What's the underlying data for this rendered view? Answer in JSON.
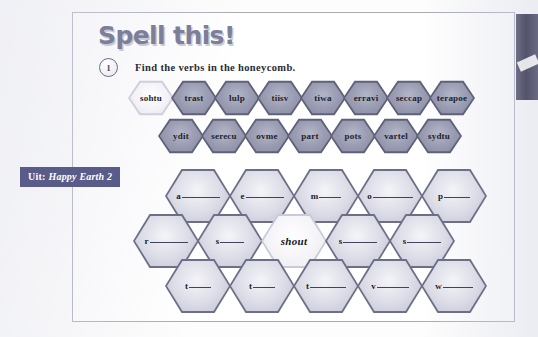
{
  "header": {
    "title": "Spell this!",
    "task_number": "1",
    "instruction": "Find the verbs in the honeycomb."
  },
  "source_label": {
    "prefix": "Uit:",
    "title": "Happy Earth 2"
  },
  "scrambled": {
    "row1": [
      {
        "text": "sohtu",
        "solved": true
      },
      {
        "text": "trast",
        "solved": false
      },
      {
        "text": "lulp",
        "solved": false
      },
      {
        "text": "tiisv",
        "solved": false
      },
      {
        "text": "tiwa",
        "solved": false
      },
      {
        "text": "erravi",
        "solved": false
      },
      {
        "text": "seccap",
        "solved": false
      },
      {
        "text": "terapoe",
        "solved": false
      }
    ],
    "row2": [
      {
        "text": "ydit",
        "solved": false
      },
      {
        "text": "serecu",
        "solved": false
      },
      {
        "text": "ovme",
        "solved": false
      },
      {
        "text": "part",
        "solved": false
      },
      {
        "text": "pots",
        "solved": false
      },
      {
        "text": "vartel",
        "solved": false
      },
      {
        "text": "sydtu",
        "solved": false
      }
    ]
  },
  "answers": {
    "row1": [
      {
        "letter": "a",
        "blank": 38,
        "filled": false
      },
      {
        "letter": "e",
        "blank": 38,
        "filled": false
      },
      {
        "letter": "m",
        "blank": 22,
        "filled": false
      },
      {
        "letter": "o",
        "blank": 40,
        "filled": false
      },
      {
        "letter": "p",
        "blank": 26,
        "filled": false
      }
    ],
    "row2": [
      {
        "letter": "r",
        "blank": 38,
        "filled": false
      },
      {
        "letter": "s",
        "blank": 24,
        "filled": false
      },
      {
        "word": "shout",
        "filled": true
      },
      {
        "letter": "s",
        "blank": 34,
        "filled": false
      },
      {
        "letter": "s",
        "blank": 34,
        "filled": false
      }
    ],
    "row3": [
      {
        "letter": "t",
        "blank": 22,
        "filled": false
      },
      {
        "letter": "t",
        "blank": 22,
        "filled": false
      },
      {
        "letter": "t",
        "blank": 36,
        "filled": false
      },
      {
        "letter": "v",
        "blank": 32,
        "filled": false
      },
      {
        "letter": "w",
        "blank": 30,
        "filled": false
      }
    ]
  }
}
